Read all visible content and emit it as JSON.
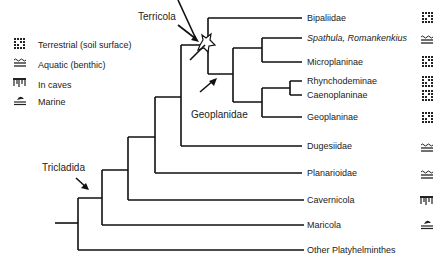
{
  "legend": [
    {
      "icon": "terrestrial-icon",
      "label": "Terrestrial (soil surface)"
    },
    {
      "icon": "aquatic-icon",
      "label": "Aquatic (benthic)"
    },
    {
      "icon": "cave-icon",
      "label": "In caves"
    },
    {
      "icon": "marine-icon",
      "label": "Marine"
    }
  ],
  "annotations": {
    "terricola": "Terricola",
    "geoplanidae": "Geoplanidae",
    "tricladida": "Tricladida"
  },
  "taxa": [
    {
      "name": "Bipaliidae",
      "habitat": "terrestrial",
      "italic": false
    },
    {
      "name": "Spathula, Romankenkius",
      "habitat": "aquatic",
      "italic": true
    },
    {
      "name": "Microplaninae",
      "habitat": "terrestrial",
      "italic": false
    },
    {
      "name": "Rhynchodeminae",
      "habitat": "terrestrial",
      "italic": false
    },
    {
      "name": "Caenoplaninae",
      "habitat": "terrestrial",
      "italic": false
    },
    {
      "name": "Geoplaninae",
      "habitat": "terrestrial",
      "italic": false
    },
    {
      "name": "Dugesiidae",
      "habitat": "aquatic",
      "italic": false
    },
    {
      "name": "Planarioidae",
      "habitat": "aquatic",
      "italic": false
    },
    {
      "name": "Cavernicola",
      "habitat": "cave",
      "italic": false
    },
    {
      "name": "Maricola",
      "habitat": "marine",
      "italic": false
    },
    {
      "name": "Other Platyhelminthes",
      "habitat": "none",
      "italic": false
    }
  ]
}
